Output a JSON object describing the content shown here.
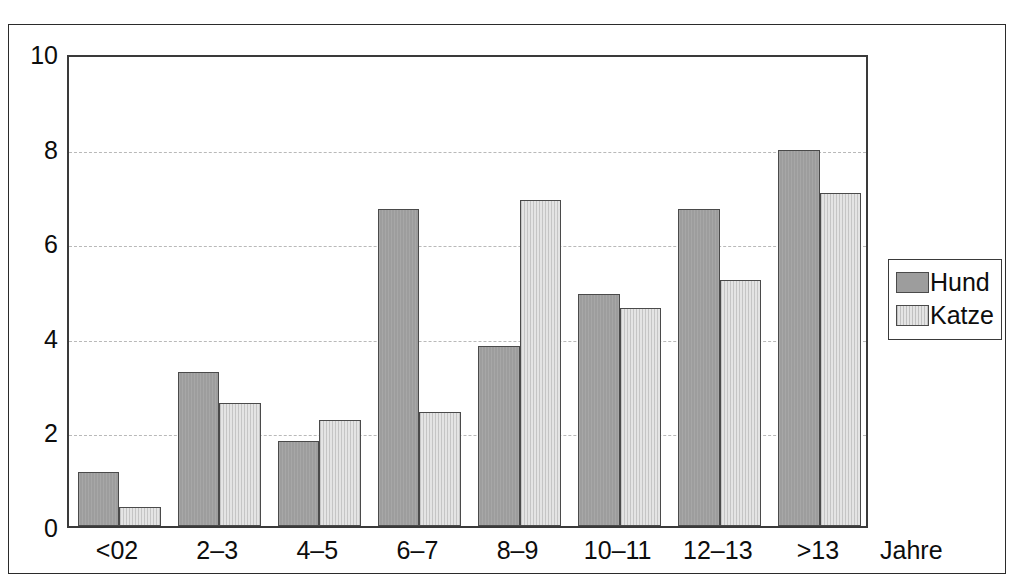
{
  "chart_data": {
    "type": "bar",
    "title": "",
    "subtitle": "",
    "xlabel": "Jahre",
    "ylabel": "",
    "categories": [
      "<02",
      "2–3",
      "4–5",
      "6–7",
      "8–9",
      "10–11",
      "12–13",
      ">13"
    ],
    "series": [
      {
        "name": "Hund",
        "color": "#9d9d9d",
        "values": [
          1.15,
          3.25,
          1.8,
          6.7,
          3.8,
          4.9,
          6.7,
          7.95
        ]
      },
      {
        "name": "Katze",
        "color": "#e4e4e4",
        "values": [
          0.4,
          2.6,
          2.25,
          2.4,
          6.9,
          4.6,
          5.2,
          7.05
        ]
      }
    ],
    "ylim": [
      0,
      10
    ],
    "yticks": [
      0,
      2,
      4,
      6,
      8,
      10
    ],
    "ytick_labels": [
      "0",
      "2",
      "4",
      "6",
      "8",
      "10"
    ],
    "gridlines": [
      2,
      4,
      6,
      8
    ],
    "grid": true,
    "grid_axis": "y",
    "grid_style": "dashed",
    "legend_position": "right-outside",
    "legend_entries": [
      "Hund",
      "Katze"
    ]
  },
  "axes": {
    "x_unit_label": "Jahre"
  },
  "legend": {
    "items": [
      {
        "label": "Hund",
        "swatch": "dark-gray-swatch"
      },
      {
        "label": "Katze",
        "swatch": "light-gray-swatch"
      }
    ]
  },
  "colors": {
    "series_hund": "#9d9d9d",
    "series_katze": "#e4e4e4",
    "bar_outline": "#4a4a4a",
    "axis": "#3a3a3a",
    "frame": "#2b2b2b",
    "gridline": "#b9b9b9",
    "text": "#0d0d0d",
    "background": "#ffffff"
  }
}
